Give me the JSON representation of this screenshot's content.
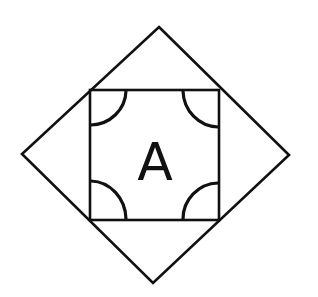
{
  "diagram": {
    "label": "A",
    "stroke_color": "#111111",
    "background": "#ffffff",
    "outer_shape": "diamond",
    "inner_shape": "square",
    "corner_marks": "quarter-circle arcs at four inner corners"
  }
}
